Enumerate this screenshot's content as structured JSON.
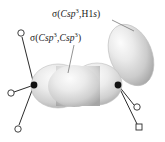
{
  "figure": {
    "background_color": "#ffffff",
    "width": 165,
    "height": 142
  },
  "labels": {
    "sigma_csp3_h1s": {
      "sigma": "σ(",
      "c": "C",
      "sp": "sp",
      "exp": "3",
      "comma": ",H1",
      "s_it": "s",
      "close": ")",
      "full_text": "σ(Csp3,H1s)"
    },
    "sigma_csp3_csp3": {
      "sigma": "σ(",
      "c1": "C",
      "sp1": "sp",
      "exp1": "3",
      "comma": ",",
      "c2": "C",
      "sp2": "sp",
      "exp2": "3",
      "close": ")",
      "full_text": "σ(Csp3,Csp3)"
    }
  },
  "colors": {
    "lobe_light": "#fbfbfb",
    "lobe_mid": "#d6d6d6",
    "lobe_dark": "#9d9d9d",
    "bond_stroke": "#2b2b2b",
    "atom_fill": "#111111",
    "leader_stroke": "#777777",
    "text": "#1a1a1a"
  },
  "atoms": [
    {
      "id": "carbon-left",
      "x": 34,
      "y": 85
    },
    {
      "id": "carbon-right",
      "x": 118,
      "y": 85
    }
  ],
  "hydrogens": [
    {
      "id": "hydrogen-upper-left",
      "x": 21,
      "y": 33,
      "shape": "circle"
    },
    {
      "id": "hydrogen-left",
      "x": 11,
      "y": 93,
      "shape": "circle"
    },
    {
      "id": "hydrogen-lower-left",
      "x": 18,
      "y": 129,
      "shape": "circle"
    },
    {
      "id": "hydrogen-lower-right-upper",
      "x": 137,
      "y": 107,
      "shape": "circle"
    },
    {
      "id": "hydrogen-lower-right-lower",
      "x": 139,
      "y": 127,
      "shape": "square"
    }
  ],
  "orbitals": [
    {
      "id": "sigma-cc-lobe",
      "type": "peanut",
      "label_ref": "sigma_csp3_csp3"
    },
    {
      "id": "sigma-ch-lobe",
      "type": "oval",
      "label_ref": "sigma_csp3_h1s"
    }
  ],
  "leader_lines": [
    {
      "id": "leader-csp3-h1s",
      "from": [
        112,
        20
      ],
      "to": [
        134,
        31
      ]
    },
    {
      "id": "leader-csp3-csp3",
      "from": [
        74,
        45
      ],
      "to": [
        68,
        73
      ]
    }
  ]
}
